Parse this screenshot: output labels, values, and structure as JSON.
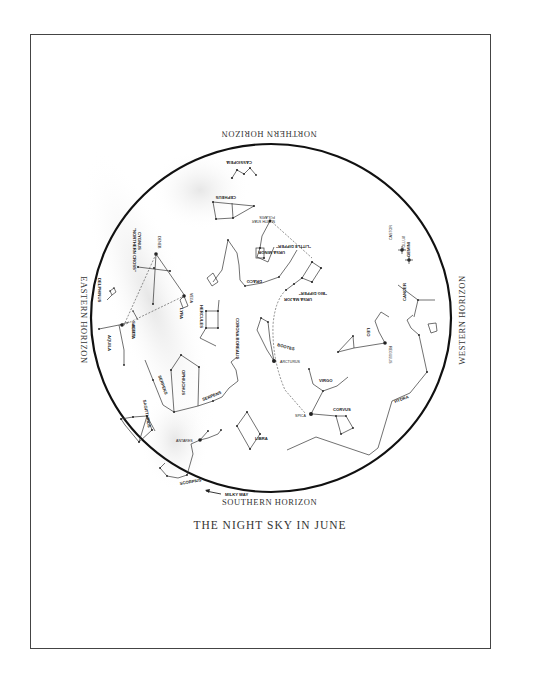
{
  "title": "THE NIGHT SKY IN JUNE",
  "horizons": {
    "north": "NORTHERN HORIZON",
    "south": "SOUTHERN HORIZON",
    "east": "EASTERN HORIZON",
    "west": "WESTERN HORIZON"
  },
  "constellations": {
    "cassiopeia": "CASSIOPEIA",
    "cepheus": "CEPHEUS",
    "ursa_minor": "URSA MINOR",
    "little_dipper": "\"LITTLE DIPPER\"",
    "ursa_major": "URSA MAJOR",
    "big_dipper": "\"BIG DIPPER\"",
    "draco": "DRACO",
    "cygnus": "CYGNUS",
    "northern_cross": "\"NORTHERN CROSS\"",
    "delphinus": "DELPHINUS",
    "sagitta": "SAGITTA",
    "aquila": "AQUILA",
    "lyra": "LYRA",
    "hercules": "HERCULES",
    "corona_borealis": "CORONA BOREALIS",
    "bootes": "BOOTES",
    "virgo": "VIRGO",
    "corvus": "CORVUS",
    "hydra": "HYDRA",
    "leo": "LEO",
    "cancer": "CANCER",
    "gemini": "GEMINI",
    "ophiuchus": "OPHIUCHUS",
    "serpens_1": "SERPENS",
    "serpens_2": "SERPENS",
    "sagittarius": "SAGITTARIUS",
    "scorpius": "SCORPIUS",
    "libra": "LIBRA"
  },
  "stars": {
    "polaris": "POLARIS",
    "north_star": "NORTH STAR",
    "deneb": "DENEB",
    "vega": "VEGA",
    "altair": "ALTAIR",
    "arcturus": "ARCTURUS",
    "spica": "SPICA",
    "regulus": "REGULUS",
    "castor": "CASTOR",
    "pollux": "POLLUX",
    "antares": "ANTARES"
  },
  "annotations": {
    "milky_way": "MILKY WAY"
  }
}
